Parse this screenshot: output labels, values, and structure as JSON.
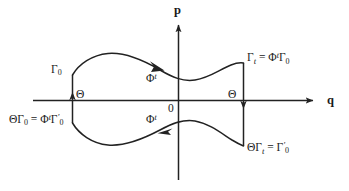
{
  "figure": {
    "kind": "phase-space-diagram",
    "background_color": "#ffffff",
    "line_color": "#222222",
    "text_color": "#1a1a1a",
    "axes": {
      "vertical_label": "p",
      "horizontal_label": "q",
      "origin_label": "0"
    },
    "labels": {
      "gamma_0": {
        "base": "Γ",
        "sub": "0"
      },
      "gamma_t_maps": {
        "lhs_base": "Γ",
        "lhs_sub": "t",
        "equals": "=",
        "rhs_phi": "Φ",
        "rhs_phi_sup": "t",
        "rhs_gamma": "Γ",
        "rhs_sub": "0"
      },
      "theta_gamma_0_maps": {
        "theta": "Θ",
        "lhs_gamma": "Γ",
        "lhs_sub": "0",
        "equals": "=",
        "rhs_phi": "Φ",
        "rhs_phi_sup": "t",
        "rhs_gamma": "Γ",
        "rhs_prime": "′",
        "rhs_sub": "0"
      },
      "theta_gamma_t_maps": {
        "theta": "Θ",
        "lhs_gamma": "Γ",
        "lhs_sub": "t",
        "equals": "=",
        "rhs_gamma": "Γ",
        "rhs_prime": "′",
        "rhs_sub": "0"
      },
      "phi_flow_upper": {
        "base": "Φ",
        "sup": "t"
      },
      "phi_flow_lower": {
        "base": "Φ",
        "sup": "t"
      },
      "theta_left": "Θ",
      "theta_right": "Θ"
    },
    "text_strings": {
      "gamma_0": "Γ0",
      "gamma_t_eq": "Γt = ΦtΓ0",
      "theta_gamma_0_eq": "ΘΓ0 = ΦtΓ′0",
      "theta_gamma_t_eq": "ΘΓt = Γ′0",
      "phi_upper": "Φt",
      "phi_lower": "Φt",
      "origin": "0",
      "axis_p": "p",
      "axis_q": "q",
      "theta_left": "Θ",
      "theta_right": "Θ"
    }
  }
}
